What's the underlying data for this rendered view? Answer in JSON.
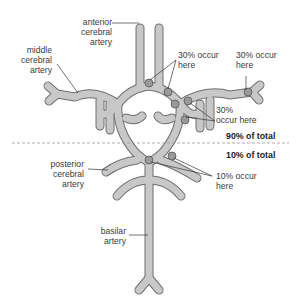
{
  "labels": {
    "anterior_cerebral_artery": [
      "anterior",
      "cerebral",
      "artery"
    ],
    "middle_cerebral_artery": [
      "middle",
      "cerebral",
      "artery"
    ],
    "posterior_cerebral_artery": [
      "posterior",
      "cerebral",
      "artery"
    ],
    "basilar_artery": [
      "basilar",
      "artery"
    ],
    "occurrence_top_center": [
      "30% occur",
      "here"
    ],
    "occurrence_top_right": [
      "30% occur",
      "here"
    ],
    "occurrence_middle_right": [
      "30%",
      "occur here"
    ],
    "occurrence_lower": [
      "10% occur",
      "here"
    ],
    "region_upper_total": "90% of total",
    "region_lower_total": "10% of total"
  },
  "colors": {
    "artery_fill": "#c8c8c8",
    "artery_outline": "#6e6e6e",
    "aneurysm_fill": "#9a9a9a",
    "divider": "#9a9a9a",
    "text": "#3a3a3a"
  }
}
